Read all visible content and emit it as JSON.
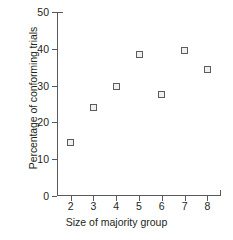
{
  "chart_data": {
    "type": "scatter",
    "title": "",
    "xlabel": "Size of majority group",
    "ylabel": "Percentage of conforming trials",
    "x": [
      2,
      3,
      4,
      5,
      6,
      7,
      8
    ],
    "values": [
      14.5,
      24.0,
      29.7,
      38.5,
      27.5,
      39.5,
      34.3
    ],
    "series": [
      {
        "name": "Conforming trials",
        "points": [
          {
            "x": 2,
            "y": 14.5
          },
          {
            "x": 3,
            "y": 24.0
          },
          {
            "x": 4,
            "y": 29.7
          },
          {
            "x": 5,
            "y": 38.5
          },
          {
            "x": 6,
            "y": 27.5
          },
          {
            "x": 7,
            "y": 39.5
          },
          {
            "x": 8,
            "y": 34.3
          }
        ]
      }
    ],
    "xlim": [
      1.4,
      8.6
    ],
    "ylim": [
      0,
      50
    ],
    "xticks": [
      2,
      3,
      4,
      5,
      6,
      7,
      8
    ],
    "xtick_labels": [
      "2",
      "3",
      "4",
      "5",
      "6",
      "7",
      "8"
    ],
    "yticks": [
      0,
      10,
      20,
      30,
      40,
      50
    ],
    "ytick_labels": [
      "0",
      "10",
      "20",
      "30",
      "40",
      "50"
    ],
    "grid": false,
    "legend": "none",
    "marker_color": "#5b5c5e",
    "marker_fill": "#f0f0f0",
    "axis_color": "#58595b",
    "text_color": "#231f20",
    "background": "#ffffff"
  }
}
